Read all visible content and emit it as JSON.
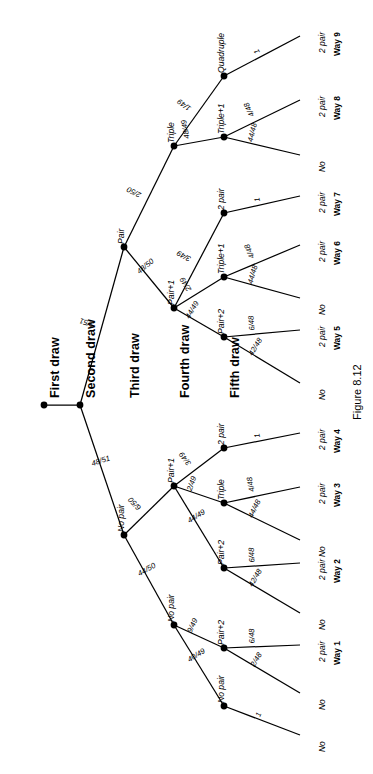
{
  "figure": {
    "caption": "Figure 8.12",
    "type": "probability-tree-diagram",
    "orientation": "rotated-90-counterclockwise"
  },
  "column_headers": [
    {
      "label": "First draw",
      "pos": 44
    },
    {
      "label": "Second draw",
      "pos": 80
    },
    {
      "label": "Third draw",
      "pos": 124
    },
    {
      "label": "Fourth draw",
      "pos": 174
    },
    {
      "label": "Fifth draw",
      "pos": 224
    }
  ],
  "chart_data": {
    "type": "tree",
    "title": "Figure 8.12",
    "stages": [
      "First draw",
      "Second draw",
      "Third draw",
      "Fourth draw",
      "Fifth draw"
    ],
    "nodes": [
      {
        "id": "n0",
        "stage": 1,
        "label": "",
        "x": 44,
        "y": 405
      },
      {
        "id": "n1",
        "stage": 2,
        "label": "",
        "x": 80,
        "y": 405
      },
      {
        "id": "n2",
        "stage": 3,
        "label": "Pair",
        "x": 124,
        "y": 247
      },
      {
        "id": "n3",
        "stage": 3,
        "label": "No pair",
        "x": 124,
        "y": 535
      },
      {
        "id": "n4",
        "stage": 4,
        "label": "Triple",
        "x": 174,
        "y": 146
      },
      {
        "id": "n5",
        "stage": 4,
        "label": "Pair+1",
        "x": 174,
        "y": 308
      },
      {
        "id": "n6",
        "stage": 4,
        "label": "Pair+1",
        "x": 174,
        "y": 486
      },
      {
        "id": "n7",
        "stage": 4,
        "label": "No pair",
        "x": 174,
        "y": 625
      },
      {
        "id": "n8",
        "stage": 5,
        "label": "Quadruple",
        "x": 224,
        "y": 76
      },
      {
        "id": "n9",
        "stage": 5,
        "label": "Triple+1",
        "x": 224,
        "y": 137
      },
      {
        "id": "n10",
        "stage": 5,
        "label": "2 pair",
        "x": 224,
        "y": 213
      },
      {
        "id": "n11",
        "stage": 5,
        "label": "Triple+1",
        "x": 224,
        "y": 277
      },
      {
        "id": "n12",
        "stage": 5,
        "label": "Pair+2",
        "x": 224,
        "y": 337
      },
      {
        "id": "n13",
        "stage": 5,
        "label": "2 pair",
        "x": 224,
        "y": 448
      },
      {
        "id": "n14",
        "stage": 5,
        "label": "Triple",
        "x": 224,
        "y": 503
      },
      {
        "id": "n15",
        "stage": 5,
        "label": "Pair+2",
        "x": 224,
        "y": 568
      },
      {
        "id": "n16",
        "stage": 5,
        "label": "Pair+2",
        "x": 224,
        "y": 648
      },
      {
        "id": "n17",
        "stage": 5,
        "label": "No pair",
        "x": 224,
        "y": 706
      }
    ],
    "edges": [
      {
        "from": "n0",
        "to": "n1",
        "prob": ""
      },
      {
        "from": "n1",
        "to": "n2",
        "prob": "3/51"
      },
      {
        "from": "n1",
        "to": "n3",
        "prob": "48/51"
      },
      {
        "from": "n2",
        "to": "n4",
        "prob": "2/50"
      },
      {
        "from": "n2",
        "to": "n5",
        "prob": "48/50"
      },
      {
        "from": "n3",
        "to": "n6",
        "prob": "6/50"
      },
      {
        "from": "n3",
        "to": "n7",
        "prob": "44/50"
      },
      {
        "from": "n4",
        "to": "n8",
        "prob": "1/49"
      },
      {
        "from": "n4",
        "to": "n9",
        "prob": "48/49"
      },
      {
        "from": "n5",
        "to": "n10",
        "prob": "3/49"
      },
      {
        "from": "n5",
        "to": "n11",
        "prob": "2/49"
      },
      {
        "from": "n5",
        "to": "n12",
        "prob": "44/49"
      },
      {
        "from": "n6",
        "to": "n13",
        "prob": "3/49"
      },
      {
        "from": "n6",
        "to": "n14",
        "prob": "2/49"
      },
      {
        "from": "n6",
        "to": "n15",
        "prob": "44/49"
      },
      {
        "from": "n7",
        "to": "n16",
        "prob": "9/49"
      },
      {
        "from": "n7",
        "to": "n17",
        "prob": "40/49"
      }
    ],
    "terminals": [
      {
        "from": "n8",
        "prob": "1",
        "outcome": "2 pair",
        "way": "Way 9",
        "y": 36
      },
      {
        "from": "n9",
        "prob": "4/48",
        "outcome": "2 pair",
        "way": "Way 8",
        "y": 100
      },
      {
        "from": "n9",
        "prob": "44/48",
        "outcome": "No",
        "way": "",
        "y": 155
      },
      {
        "from": "n10",
        "prob": "1",
        "outcome": "2 pair",
        "way": "Way 7",
        "y": 196
      },
      {
        "from": "n11",
        "prob": "4/48",
        "outcome": "2 pair",
        "way": "Way 6",
        "y": 245
      },
      {
        "from": "n11",
        "prob": "44/48",
        "outcome": "No",
        "way": "",
        "y": 298
      },
      {
        "from": "n12",
        "prob": "6/48",
        "outcome": "2 pair",
        "way": "Way 5",
        "y": 330
      },
      {
        "from": "n12",
        "prob": "42/48",
        "outcome": "No",
        "way": "",
        "y": 383
      },
      {
        "from": "n13",
        "prob": "1",
        "outcome": "2 pair",
        "way": "Way 4",
        "y": 433
      },
      {
        "from": "n14",
        "prob": "4/48",
        "outcome": "2 pair",
        "way": "Way 3",
        "y": 487
      },
      {
        "from": "n14",
        "prob": "44/48",
        "outcome": "No",
        "way": "",
        "y": 540
      },
      {
        "from": "n15",
        "prob": "6/48",
        "outcome": "2 pair",
        "way": "Way 2",
        "y": 563
      },
      {
        "from": "n15",
        "prob": "42/48",
        "outcome": "No",
        "way": "",
        "y": 613
      },
      {
        "from": "n16",
        "prob": "6/48",
        "outcome": "2 pair",
        "way": "Way 1",
        "y": 645
      },
      {
        "from": "n16",
        "prob": "2/48",
        "outcome": "No",
        "way": "",
        "y": 693
      },
      {
        "from": "n17",
        "prob": "1",
        "outcome": "No",
        "way": "",
        "y": 735
      }
    ],
    "terminal_x": 300,
    "outcome_label_x": 318,
    "way_label_x": 333
  }
}
